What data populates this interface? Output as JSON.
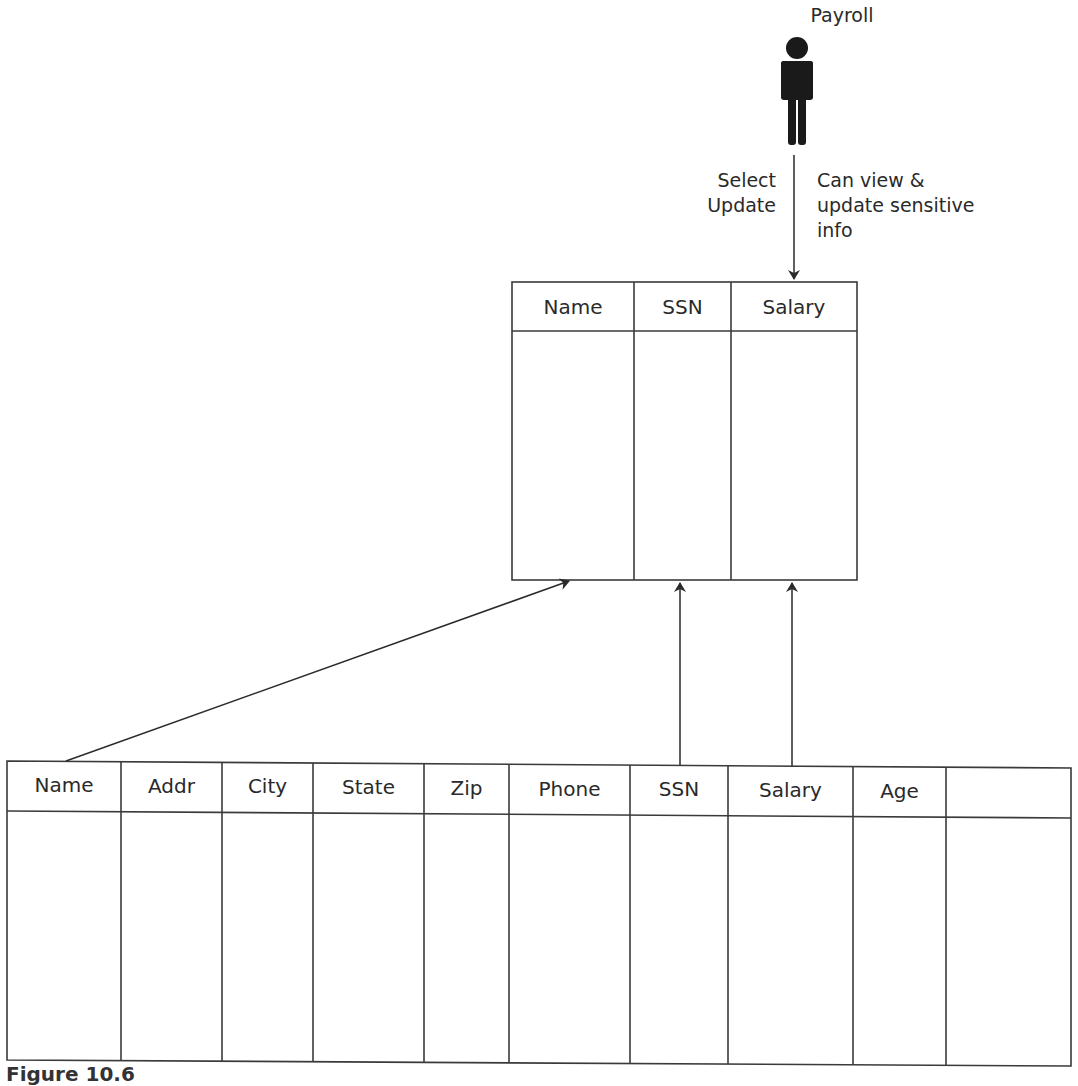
{
  "actor": {
    "label": "Payroll",
    "icon": "person-icon"
  },
  "access_arrow": {
    "operations": [
      "Select",
      "Update"
    ],
    "description": [
      "Can view &",
      "update sensitive",
      "info"
    ]
  },
  "view_table": {
    "columns": [
      "Name",
      "SSN",
      "Salary"
    ]
  },
  "base_table": {
    "columns": [
      "Name",
      "Addr",
      "City",
      "State",
      "Zip",
      "Phone",
      "SSN",
      "Salary",
      "Age",
      ""
    ]
  },
  "caption": "Figure 10.6",
  "colors": {
    "line": "#3a3a3a",
    "figure": "#1a1a1a",
    "background": "#ffffff"
  }
}
